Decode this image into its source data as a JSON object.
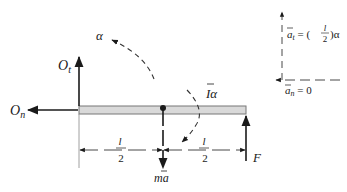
{
  "diagram": {
    "type": "free-body-and-kinetic-diagram",
    "colors": {
      "ink": "#1a1a1a",
      "beam_fill": "#d9d9d9",
      "beam_stroke": "#777777",
      "dashed": "#333333"
    },
    "forces": {
      "Ot": {
        "main": "O",
        "sub": "t"
      },
      "On": {
        "main": "O",
        "sub": "n"
      },
      "F": "F",
      "ma": "ma"
    },
    "angular": {
      "alpha": "α",
      "I_alpha": "Iα"
    },
    "dimensions": {
      "left_half": {
        "num": "l",
        "den": "2"
      },
      "right_half": {
        "num": "l",
        "den": "2"
      }
    },
    "accelerations": {
      "at_lhs": "a",
      "at_sub": "t",
      "at_rhs_prefix": " = (",
      "at_frac_num": "l",
      "at_frac_den": "2",
      "at_rhs_suffix": ")α",
      "an_lhs": "a",
      "an_sub": "n",
      "an_rhs": " = 0"
    }
  }
}
